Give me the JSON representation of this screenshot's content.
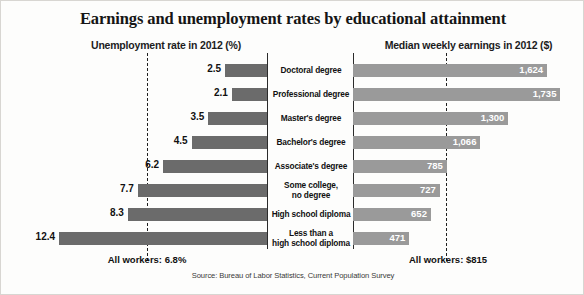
{
  "chart_data": {
    "type": "bar",
    "title": "Earnings and unemployment rates by educational attainment",
    "orientation": "horizontal-diverging",
    "categories": [
      "Doctoral degree",
      "Professional degree",
      "Master's degree",
      "Bachelor's degree",
      "Associate's degree",
      "Some college,\nno degree",
      "High school diploma",
      "Less than a\nhigh school diploma"
    ],
    "series": [
      {
        "name": "Unemployment rate in 2012 (%)",
        "side": "left",
        "unit": "%",
        "color": "#6b6b6b",
        "values": [
          2.5,
          2.1,
          3.5,
          4.5,
          6.2,
          7.7,
          8.3,
          12.4
        ],
        "labels": [
          "2.5",
          "2.1",
          "3.5",
          "4.5",
          "6.2",
          "7.7",
          "8.3",
          "12.4"
        ],
        "axis_max": 13.0,
        "reference_line": 6.8,
        "reference_label": "All workers: 6.8%"
      },
      {
        "name": "Median weekly earnings in 2012 ($)",
        "side": "right",
        "unit": "$",
        "color": "#9a9a9a",
        "values": [
          1624,
          1735,
          1300,
          1066,
          785,
          727,
          652,
          471
        ],
        "labels": [
          "1,624",
          "1,735",
          "1,300",
          "1,066",
          "785",
          "727",
          "652",
          "471"
        ],
        "axis_max": 1790,
        "reference_line": 815,
        "reference_label": "All workers: $815"
      }
    ],
    "xlabel_left": "Unemployment rate in 2012 (%)",
    "xlabel_right": "Median weekly earnings in 2012 ($)",
    "ylabel": "",
    "grid": false,
    "legend": "none",
    "source": "Source: Bureau of Labor Statistics, Current Population Survey"
  },
  "header": {
    "title": "Earnings and unemployment rates by educational attainment",
    "subtitle_left": "Unemployment rate in 2012 (%)",
    "subtitle_right": "Median weekly earnings in 2012 ($)"
  },
  "footer": {
    "all_workers_left": "All workers: 6.8%",
    "all_workers_right": "All workers: $815",
    "source": "Source: Bureau of Labor Statistics, Current Population Survey"
  }
}
